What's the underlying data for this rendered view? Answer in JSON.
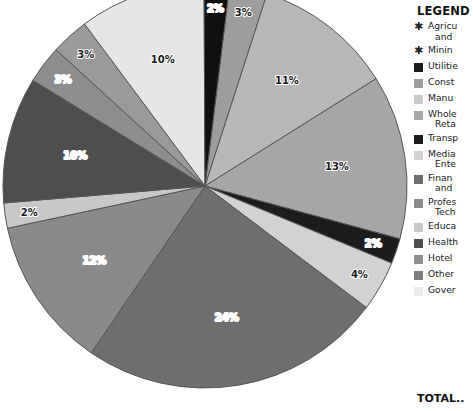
{
  "chart_data": {
    "type": "pie",
    "title": "",
    "legend_position": "right",
    "value_suffix": "%",
    "center": {
      "x": 205,
      "y": 186
    },
    "radius": 202,
    "start_angle_deg": -83,
    "labels": [
      "Agriculture and Forestry",
      "Mining",
      "Utilities",
      "Construction",
      "Manufacturing",
      "Wholesale and Retail Trade",
      "Transportation",
      "Media and Entertainment",
      "Finance and Insurance",
      "Professional and Technical",
      "Education",
      "Health Care",
      "Hotel",
      "Other Services",
      "Government"
    ],
    "slices": [
      {
        "label": "Agriculture and Forestry",
        "value": 0,
        "display": "",
        "color": "#b4b4b4",
        "show_label": false
      },
      {
        "label": "Mining",
        "value": 0,
        "display": "",
        "color": "#b4b4b4",
        "show_label": false
      },
      {
        "label": "Utilities",
        "value": 3,
        "display": "3%",
        "color": "#9d9d9d",
        "show_label": true
      },
      {
        "label": "Construction",
        "value": 11,
        "display": "11%",
        "color": "#b8b8b8",
        "show_label": true
      },
      {
        "label": "Manufacturing",
        "value": 13,
        "display": "13%",
        "color": "#a6a6a6",
        "show_label": true
      },
      {
        "label": "Wholesale and Retail Trade",
        "value": 2,
        "display": "2%",
        "color": "#1c1c1c",
        "show_label": true
      },
      {
        "label": "Transportation",
        "value": 4,
        "display": "4%",
        "color": "#d2d2d2",
        "show_label": true
      },
      {
        "label": "Media and Entertainment",
        "value": 24,
        "display": "24%",
        "color": "#6e6e6e",
        "show_label": true
      },
      {
        "label": "Finance and Insurance",
        "value": 12,
        "display": "12%",
        "color": "#8a8a8a",
        "show_label": true
      },
      {
        "label": "Professional and Technical",
        "value": 2,
        "display": "2%",
        "color": "#c8c8c8",
        "show_label": true
      },
      {
        "label": "Education",
        "value": 10,
        "display": "10%",
        "color": "#4e4e4e",
        "show_label": true
      },
      {
        "label": "Health Care",
        "value": 3,
        "display": "3%",
        "color": "#8e8e8e",
        "show_label": true
      },
      {
        "label": "Hotel",
        "value": 3,
        "display": "3%",
        "color": "#9a9a9a",
        "show_label": true
      },
      {
        "label": "Other Services",
        "value": 10,
        "display": "10%",
        "color": "#e6e6e6",
        "show_label": true
      },
      {
        "label": "Government",
        "value": 2,
        "display": "2%",
        "color": "#101010",
        "show_label": true
      }
    ],
    "total": 100
  },
  "legend": {
    "title": "LEGEND",
    "total_label": "TOTAL..",
    "items": [
      {
        "marker": "star",
        "color": "",
        "line1": "Agricu",
        "line2": "and"
      },
      {
        "marker": "star",
        "color": "",
        "line1": "Minin",
        "line2": ""
      },
      {
        "marker": "swatch",
        "color": "#1c1c1c",
        "line1": "Utilitie",
        "line2": ""
      },
      {
        "marker": "swatch",
        "color": "#9d9d9d",
        "line1": "Const",
        "line2": ""
      },
      {
        "marker": "swatch",
        "color": "#c9c9c9",
        "line1": "Manu",
        "line2": ""
      },
      {
        "marker": "swatch",
        "color": "#a8a8a8",
        "line1": "Whole",
        "line2": "Reta"
      },
      {
        "marker": "swatch",
        "color": "#1c1c1c",
        "line1": "Transp",
        "line2": ""
      },
      {
        "marker": "swatch",
        "color": "#d2d2d2",
        "line1": "Media",
        "line2": "Ente"
      },
      {
        "marker": "swatch",
        "color": "#6e6e6e",
        "line1": "Finan",
        "line2": "and"
      },
      {
        "marker": "swatch",
        "color": "#8a8a8a",
        "line1": "Profes",
        "line2": "Tech"
      },
      {
        "marker": "swatch",
        "color": "#c8c8c8",
        "line1": "Educa",
        "line2": ""
      },
      {
        "marker": "swatch",
        "color": "#4e4e4e",
        "line1": "Health",
        "line2": ""
      },
      {
        "marker": "swatch",
        "color": "#8e8e8e",
        "line1": "Hotel",
        "line2": ""
      },
      {
        "marker": "swatch",
        "color": "#7d7d7d",
        "line1": "Other",
        "line2": ""
      },
      {
        "marker": "swatch",
        "color": "#eaeaea",
        "line1": "Gover",
        "line2": ""
      }
    ]
  },
  "colors": {
    "background": "#ffffff",
    "text": "#111111",
    "slice_border": "#555555",
    "label_text": "#ffffff",
    "label_text_dark": "#1a1a1a"
  }
}
